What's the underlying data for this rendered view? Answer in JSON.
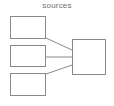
{
  "diagram": {
    "title": "sources",
    "title_color": "#6e6e6e",
    "background_color": "#ffffff",
    "stroke_color": "#8a8a8a",
    "node_fill_color": "#ffffff",
    "nodes": [
      {
        "id": "src1",
        "label": "",
        "role": "source"
      },
      {
        "id": "src2",
        "label": "",
        "role": "source"
      },
      {
        "id": "src3",
        "label": "",
        "role": "source"
      },
      {
        "id": "target",
        "label": "",
        "role": "target"
      }
    ],
    "edges": [
      {
        "from": "src1",
        "to": "target",
        "label": ""
      },
      {
        "from": "src2",
        "to": "target",
        "label": ""
      },
      {
        "from": "src3",
        "to": "target",
        "label": ""
      }
    ]
  }
}
